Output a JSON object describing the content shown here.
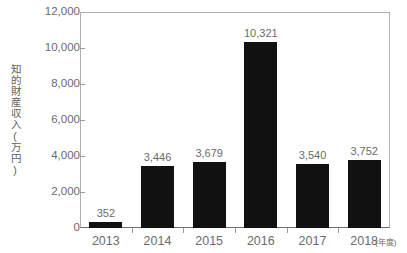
{
  "chart_data": {
    "type": "bar",
    "title": "",
    "subtitle": "",
    "xlabel": "(年度)",
    "ylabel": "知的財産収入(万円)",
    "categories": [
      "2013",
      "2014",
      "2015",
      "2016",
      "2017",
      "2018"
    ],
    "values": [
      352,
      3446,
      3679,
      10321,
      3540,
      3752
    ],
    "value_labels": [
      "352",
      "3,446",
      "3,679",
      "10,321",
      "3,540",
      "3,752"
    ],
    "ylim": [
      0,
      12000
    ],
    "yticks": [
      0,
      2000,
      4000,
      6000,
      8000,
      10000,
      12000
    ],
    "ytick_labels": [
      "0",
      "2,000",
      "4,000",
      "6,000",
      "8,000",
      "10,000",
      "12,000"
    ],
    "grid": false,
    "legend": null,
    "bar_color": "#111111",
    "axis_color": "#adadad",
    "text_color": "#6b6b6b",
    "background": "#ffffff"
  }
}
